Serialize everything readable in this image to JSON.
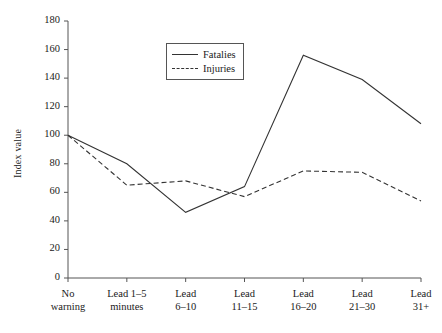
{
  "chart_data": {
    "type": "line",
    "title": "",
    "xlabel": "",
    "ylabel": "Index value",
    "ylim": [
      0,
      180
    ],
    "yticks": [
      0,
      20,
      40,
      60,
      80,
      100,
      120,
      140,
      160,
      180
    ],
    "grid": false,
    "legend_position": "top-center",
    "categories": [
      "No\nwarning",
      "Lead 1–5\nminutes",
      "Lead\n6–10",
      "Lead\n11–15",
      "Lead\n16–20",
      "Lead\n21–30",
      "Lead\n31+"
    ],
    "series": [
      {
        "name": "Fatalies",
        "style": "solid",
        "color": "#333333",
        "values": [
          100,
          80,
          46,
          64,
          156,
          139,
          108
        ]
      },
      {
        "name": "Injuries",
        "style": "dashed",
        "color": "#333333",
        "values": [
          100,
          65,
          68,
          57,
          75,
          74,
          54
        ]
      }
    ]
  }
}
